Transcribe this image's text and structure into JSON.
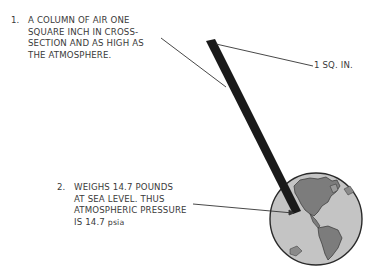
{
  "diagram": {
    "note1": {
      "number": "1.",
      "lines": [
        "A COLUMN OF AIR ONE",
        "SQUARE INCH IN CROSS-",
        "SECTION AND AS HIGH AS",
        "THE ATMOSPHERE."
      ]
    },
    "note2": {
      "number": "2.",
      "lines": [
        "WEIGHS 14.7 POUNDS",
        "AT SEA LEVEL.  THUS",
        "ATMOSPHERIC PRESSURE"
      ],
      "last_line_prefix": "IS 14.7 ",
      "last_line_unit": "psia"
    },
    "callout": {
      "label": "1 SQ. IN."
    },
    "colors": {
      "text": "#3a3a3a",
      "column": "#1a1a1a",
      "ocean": "#bdbdbd",
      "land": "#7a7a7a",
      "outline": "#2a2a2a"
    }
  }
}
